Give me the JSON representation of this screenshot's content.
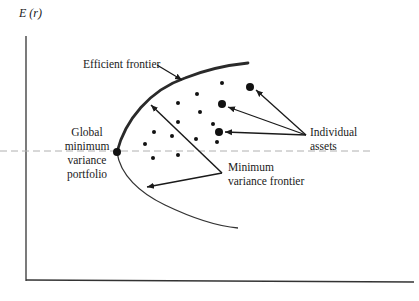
{
  "diagram": {
    "y_axis_label": "E (r)",
    "labels": {
      "efficient_frontier": "Efficient frontier",
      "gmv_line1": "Global",
      "gmv_line2": "minimum",
      "gmv_line3": "variance",
      "gmv_line4": "portfolio",
      "mvf_line1": "Minimum",
      "mvf_line2": "variance frontier",
      "assets_line1": "Individual",
      "assets_line2": "assets"
    },
    "colors": {
      "ink": "#1a1a1a",
      "dashed_line": "#b0b0b0",
      "background": "#ffffff"
    },
    "small_dots": [
      [
        222,
        83
      ],
      [
        197,
        94
      ],
      [
        178,
        103
      ],
      [
        200,
        112
      ],
      [
        178,
        122
      ],
      [
        213,
        124
      ],
      [
        154,
        132
      ],
      [
        172,
        136
      ],
      [
        196,
        139
      ],
      [
        217,
        142
      ],
      [
        145,
        144
      ],
      [
        153,
        158
      ],
      [
        178,
        155
      ]
    ],
    "large_dots": [
      [
        250,
        87
      ],
      [
        222,
        104
      ],
      [
        219,
        132
      ]
    ],
    "gmv_point": [
      117,
      152
    ]
  }
}
